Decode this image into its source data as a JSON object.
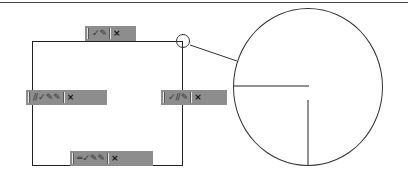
{
  "diagram": {
    "toolbars": [
      {
        "position": "top",
        "icons": [
          "check-icon",
          "pencil-icon"
        ],
        "close_label": "×"
      },
      {
        "position": "left",
        "icons": [
          "slash-icon",
          "check-icon",
          "pencil-icon",
          "pencil-icon"
        ],
        "close_label": "×"
      },
      {
        "position": "right",
        "icons": [
          "check-icon",
          "slash-icon",
          "pencil-icon"
        ],
        "close_label": "×"
      },
      {
        "position": "bottom",
        "icons": [
          "line-icon",
          "check-icon",
          "pencil-icon",
          "pencil-icon"
        ],
        "close_label": "×"
      }
    ],
    "glyphs": {
      "check-icon": "✓",
      "pencil-icon": "✎",
      "slash-icon": "//",
      "line-icon": "═"
    },
    "callout": {
      "detail": "magnified-corner",
      "source": "top-right-corner"
    },
    "colors": {
      "toolbar_bg": "#8d8d8d",
      "line": "#222222"
    }
  }
}
